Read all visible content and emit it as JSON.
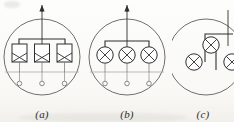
{
  "figure": {
    "type": "electrical-schematic-set",
    "panels": [
      {
        "id": "a",
        "caption": "(a)",
        "lamp_symbol": "rectangular-lamp-with-cross",
        "lamp_count": 3,
        "terminal_count": 3,
        "has_supply_arrow": true,
        "supply_arrow_direction": "up"
      },
      {
        "id": "b",
        "caption": "(b)",
        "lamp_symbol": "circular-lamp-with-cross",
        "lamp_count": 3,
        "terminal_count": 3,
        "has_supply_arrow": true,
        "supply_arrow_direction": "up"
      },
      {
        "id": "c",
        "caption": "(c)",
        "lamp_symbol": "circular-lamp-with-cross",
        "lamp_count": 3,
        "terminal_count": 0,
        "has_supply_arrow": false,
        "supply_arrow_direction": ""
      }
    ]
  },
  "style": {
    "ink": "#3a3a3a",
    "ink_light": "#7d7d7d",
    "paper": "#fdfdfc"
  }
}
